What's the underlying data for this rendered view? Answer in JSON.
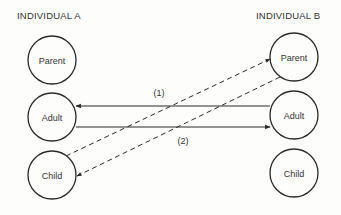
{
  "diagram": {
    "type": "transactional-analysis",
    "individual_a": {
      "title": "INDIVIDUAL A",
      "states": [
        "Parent",
        "Adult",
        "Child"
      ]
    },
    "individual_b": {
      "title": "INDIVIDUAL B",
      "states": [
        "Parent",
        "Adult",
        "Child"
      ]
    },
    "transactions": [
      {
        "label": "(1)",
        "solid": {
          "from": "B.Adult",
          "to": "A.Adult"
        },
        "dashed": {
          "from": "A.Child",
          "to": "B.Parent"
        }
      },
      {
        "label": "(2)",
        "solid": {
          "from": "A.Adult",
          "to": "B.Adult"
        },
        "dashed": {
          "from": "B.Parent",
          "to": "A.Child"
        }
      }
    ],
    "colors": {
      "stroke": "#2a2a2a",
      "background": "#fdfdfb"
    }
  }
}
